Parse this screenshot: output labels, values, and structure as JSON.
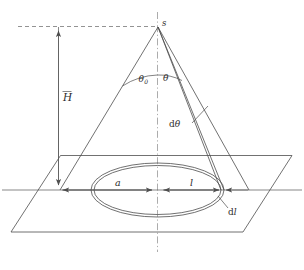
{
  "figure": {
    "background_color": "#ffffff",
    "line_color": "#4d4d4d",
    "text_color": "#2b2b2b"
  },
  "labels": {
    "apex": "s",
    "half_angle_max": "θ",
    "half_angle_max_sub": "0",
    "angle": "θ",
    "height": "H",
    "angle_increment_d": "d",
    "angle_increment_sym": "θ",
    "radius_a": "a",
    "radius_l": "l",
    "radius_increment_d": "d",
    "radius_increment_sym": "l"
  },
  "caption": {
    "text": ""
  },
  "elements": {
    "vertical_axis": "dash-dot-center-axis",
    "horizontal_axis": "ground-reference-line",
    "top_dashed_line": "apex-level-dashed-line",
    "height_arrow": "height-dimension-arrow",
    "ground_plane": "ground-plane-parallelogram",
    "cone_outline": "cone-generator-lines",
    "ray_pair": "differential-ray-pair",
    "inner_ellipse": "inner-ring-ellipse",
    "outer_ellipse": "outer-ring-ellipse",
    "angle_arc_theta0": "theta0-angle-arc",
    "angle_arc_theta": "theta-angle-arc",
    "dim_a_arrow": "radius-a-dimension",
    "dim_l_arrow": "radius-l-dimension",
    "dl_leader": "dl-leader-line",
    "dtheta_leader": "dtheta-leader-line"
  }
}
